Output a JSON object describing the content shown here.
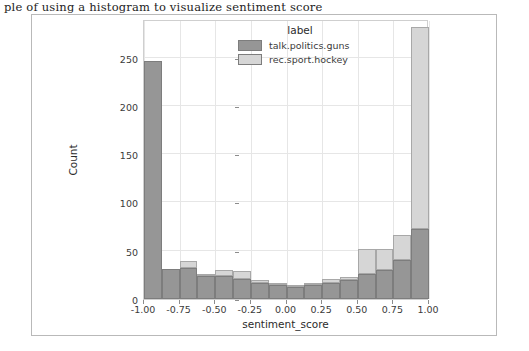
{
  "top_caption": {
    "text": "ple of using a histogram to visualize sentiment score"
  },
  "legend": {
    "title": "label",
    "items": [
      {
        "label": "talk.politics.guns",
        "color": "#969696"
      },
      {
        "label": "rec.sport.hockey",
        "color": "#d6d6d6"
      }
    ]
  },
  "axes": {
    "xlabel": "sentiment_score",
    "ylabel": "Count",
    "xticks": [
      "-1.00",
      "-0.75",
      "-0.50",
      "-0.25",
      "0.00",
      "0.25",
      "0.50",
      "0.75",
      "1.00"
    ],
    "xtick_values": [
      -1.0,
      -0.75,
      -0.5,
      -0.25,
      0.0,
      0.25,
      0.5,
      0.75,
      1.0
    ],
    "yticks": [
      "0",
      "50",
      "100",
      "150",
      "200",
      "250"
    ],
    "ytick_values": [
      0,
      50,
      100,
      150,
      200,
      250
    ]
  },
  "chart_data": {
    "type": "bar",
    "title": "",
    "subtitle": "",
    "xlabel": "sentiment_score",
    "ylabel": "Count",
    "xlim": [
      -1.0,
      1.0
    ],
    "ylim": [
      0,
      290
    ],
    "grid": true,
    "legend_position": "top-center-inside",
    "stacked": true,
    "bin_width": 0.125,
    "bin_edges": [
      -1.0,
      -0.875,
      -0.75,
      -0.625,
      -0.5,
      -0.375,
      -0.25,
      -0.125,
      0.0,
      0.125,
      0.25,
      0.375,
      0.5,
      0.625,
      0.75,
      0.875,
      1.0
    ],
    "bin_centers": [
      -0.9375,
      -0.8125,
      -0.6875,
      -0.5625,
      -0.4375,
      -0.3125,
      -0.1875,
      -0.0625,
      0.0625,
      0.1875,
      0.3125,
      0.4375,
      0.5625,
      0.6875,
      0.8125,
      0.9375
    ],
    "series": [
      {
        "name": "talk.politics.guns",
        "color": "#969696",
        "values": [
          247,
          31,
          32,
          24,
          24,
          21,
          17,
          15,
          12,
          14,
          17,
          20,
          26,
          30,
          40,
          72
        ]
      },
      {
        "name": "rec.sport.hockey",
        "color": "#d6d6d6",
        "values": [
          0,
          0,
          7,
          1,
          6,
          8,
          3,
          1,
          1,
          1,
          4,
          3,
          26,
          22,
          26,
          210
        ]
      }
    ],
    "stack_totals": [
      247,
      31,
      39,
      25,
      30,
      29,
      20,
      16,
      13,
      15,
      21,
      23,
      52,
      52,
      66,
      282
    ]
  }
}
